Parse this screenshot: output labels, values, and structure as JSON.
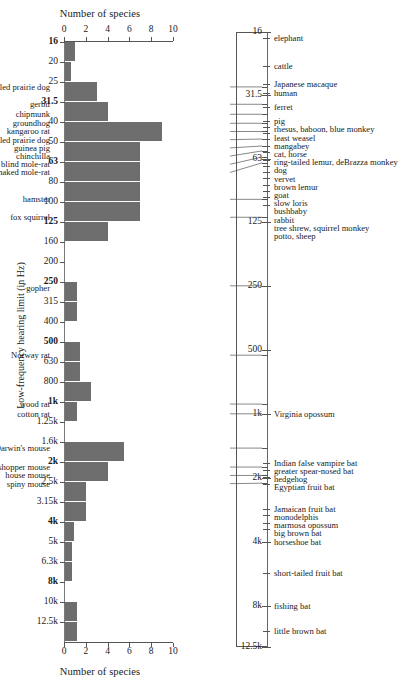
{
  "figure": {
    "x_axis_title": "Number of species",
    "y_axis_title": "Low-frequency hearing limit (in Hz)"
  },
  "chart_data": {
    "type": "bar",
    "title": "Number of species",
    "xlabel": "Number of species",
    "ylabel": "Low-frequency hearing limit (in Hz)",
    "orientation": "horizontal",
    "xlim": [
      0,
      10
    ],
    "xticks": [
      0,
      2,
      4,
      6,
      8,
      10
    ],
    "grid": false,
    "legend": null,
    "categories": [
      "16",
      "20",
      "25",
      "31.5",
      "40",
      "50",
      "63",
      "80",
      "100",
      "125",
      "160",
      "200",
      "250",
      "315",
      "400",
      "500",
      "630",
      "800",
      "1k",
      "1.25k",
      "1.6k",
      "2k",
      "2.5k",
      "3.15k",
      "4k",
      "5k",
      "6.3k",
      "8k",
      "10k",
      "12.5k"
    ],
    "bold_categories": [
      "16",
      "31.5",
      "63",
      "125",
      "250",
      "500",
      "1k",
      "2k",
      "4k",
      "8k"
    ],
    "values": [
      1,
      0.6,
      3,
      4,
      9,
      7,
      7,
      7,
      7,
      4,
      0,
      0,
      1.2,
      1.2,
      0,
      1.5,
      1.5,
      2.5,
      1.2,
      0,
      5.5,
      4,
      2,
      2,
      0.9,
      0.7,
      0.7,
      0,
      1.2,
      1.2
    ]
  },
  "species_axis": {
    "ticks": [
      {
        "label": "16",
        "freq": 16
      },
      {
        "label": "31.5",
        "freq": 31.5
      },
      {
        "label": "63",
        "freq": 63
      },
      {
        "label": "125",
        "freq": 125
      },
      {
        "label": "250",
        "freq": 250
      },
      {
        "label": "500",
        "freq": 500
      },
      {
        "label": "1k",
        "freq": 1000
      },
      {
        "label": "2k",
        "freq": 2000
      },
      {
        "label": "4k",
        "freq": 4000
      },
      {
        "label": "8k",
        "freq": 8000
      },
      {
        "label": "12.5k",
        "freq": 12500
      }
    ],
    "right_labels": [
      {
        "name": "elephant",
        "freq": 17
      },
      {
        "name": "cattle",
        "freq": 23
      },
      {
        "name": "Japanese macaque",
        "freq": 28
      },
      {
        "name": "human",
        "freq": 31
      },
      {
        "name": "ferret",
        "freq": 36
      },
      {
        "name": "pig",
        "freq": 42
      },
      {
        "name": "rhesus, baboon, blue monkey",
        "freq": 45
      },
      {
        "name": "least weasel",
        "freq": 48
      },
      {
        "name": "mangabey",
        "freq": 51
      },
      {
        "name": "cat, horse",
        "freq": 55
      },
      {
        "name": "ring-tailed lemur, deBrazza monkey",
        "freq": 59
      },
      {
        "name": "dog",
        "freq": 64
      },
      {
        "name": "vervet",
        "freq": 68
      },
      {
        "name": "brown lemur",
        "freq": 73
      },
      {
        "name": "goat",
        "freq": 78
      },
      {
        "name": "slow loris",
        "freq": 84
      },
      {
        "name": "bushbaby",
        "freq": 90
      },
      {
        "name": "rabbit",
        "freq": 96
      },
      {
        "name": "tree shrew, squirrel monkey",
        "freq": 104
      },
      {
        "name": "potto, sheep",
        "freq": 125
      },
      {
        "name": "Virginia opossum",
        "freq": 1000
      },
      {
        "name": "Indian false vampire bat",
        "freq": 1700
      },
      {
        "name": "greater spear-nosed bat",
        "freq": 1830
      },
      {
        "name": "hedgehog",
        "freq": 1980
      },
      {
        "name": "Egyptian fruit bat",
        "freq": 2150
      },
      {
        "name": "Jamaican fruit bat",
        "freq": 2800
      },
      {
        "name": "monodelphis",
        "freq": 3000
      },
      {
        "name": "marmosa opossum",
        "freq": 3250
      },
      {
        "name": "big brown bat",
        "freq": 3500
      },
      {
        "name": "horseshoe bat",
        "freq": 4000
      },
      {
        "name": "short-tailed fruit bat",
        "freq": 5600
      },
      {
        "name": "fishing bat",
        "freq": 8000
      },
      {
        "name": "little brown bat",
        "freq": 10500
      }
    ],
    "left_labels": [
      {
        "name": "black-tailed prairie dog",
        "freq": 29
      },
      {
        "name": "gerbil",
        "freq": 35
      },
      {
        "name": "chipmunk",
        "freq": 39
      },
      {
        "name": "groundhog",
        "freq": 43
      },
      {
        "name": "kangaroo rat",
        "freq": 47
      },
      {
        "name": "white-tailed prairie dog",
        "freq": 51
      },
      {
        "name": "guinea pig",
        "freq": 55
      },
      {
        "name": "chinchilla",
        "freq": 58
      },
      {
        "name": "blind mole-rat",
        "freq": 62
      },
      {
        "name": "naked mole-rat",
        "freq": 66
      },
      {
        "name": "hamster",
        "freq": 98
      },
      {
        "name": "fox squirrel",
        "freq": 119
      },
      {
        "name": "*gopher",
        "freq": 250,
        "asterisk": true
      },
      {
        "name": "Norway rat",
        "freq": 530
      },
      {
        "name": "wood rat",
        "freq": 900
      },
      {
        "name": "cotton rat",
        "freq": 1000
      },
      {
        "name": "Darwin's mouse",
        "freq": 1450
      },
      {
        "name": "grasshopper mouse",
        "freq": 1780
      },
      {
        "name": "house mouse",
        "freq": 1950
      },
      {
        "name": "spiny mouse",
        "freq": 2120
      }
    ]
  },
  "colors": {
    "bar": "#6e6e6e",
    "axis": "#555555",
    "text": "#1a1a1a"
  }
}
